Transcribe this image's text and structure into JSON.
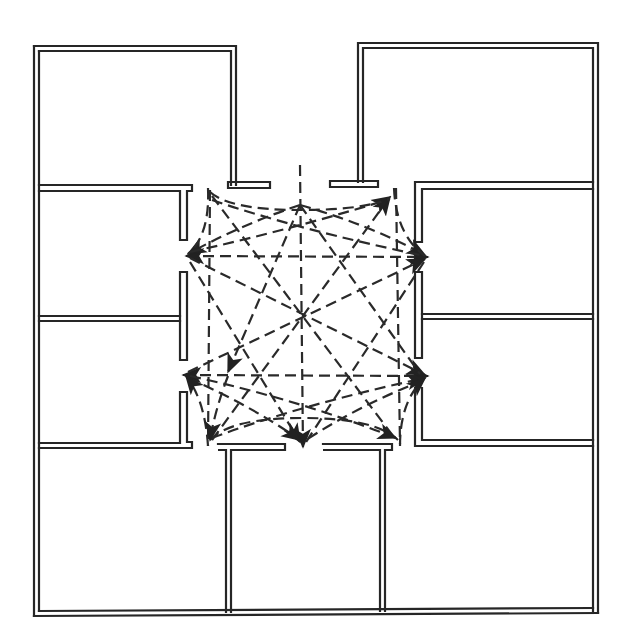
{
  "diagram": {
    "type": "floor-plan-circulation",
    "colors": {
      "ink": "#262626",
      "background": "#ffffff"
    },
    "central_hall": {
      "label": "",
      "bounds": {
        "x": 185,
        "y": 185,
        "w": 245,
        "h": 262
      }
    },
    "rooms": [
      {
        "id": "room-top-left",
        "x": 34,
        "y": 46,
        "w": 202,
        "h": 140
      },
      {
        "id": "room-top-right",
        "x": 358,
        "y": 43,
        "w": 240,
        "h": 140
      },
      {
        "id": "room-left-upper",
        "x": 34,
        "y": 186,
        "w": 148,
        "h": 130
      },
      {
        "id": "room-left-lower",
        "x": 34,
        "y": 316,
        "w": 148,
        "h": 130
      },
      {
        "id": "room-right-upper",
        "x": 420,
        "y": 183,
        "w": 178,
        "h": 132
      },
      {
        "id": "room-right-lower",
        "x": 420,
        "y": 315,
        "w": 178,
        "h": 128
      },
      {
        "id": "room-bottom-left",
        "x": 34,
        "y": 446,
        "w": 192,
        "h": 169
      },
      {
        "id": "room-bottom-middle",
        "x": 226,
        "y": 446,
        "w": 154,
        "h": 168
      },
      {
        "id": "room-bottom-right",
        "x": 380,
        "y": 443,
        "w": 218,
        "h": 170
      }
    ],
    "doorways": [
      {
        "id": "door-top-center",
        "x": 300,
        "y": 185
      },
      {
        "id": "door-left-upper",
        "x": 182,
        "y": 255
      },
      {
        "id": "door-left-lower",
        "x": 182,
        "y": 375
      },
      {
        "id": "door-right-upper",
        "x": 428,
        "y": 257
      },
      {
        "id": "door-right-lower",
        "x": 428,
        "y": 376
      },
      {
        "id": "door-bottom-center",
        "x": 303,
        "y": 450
      },
      {
        "id": "door-corner-top-left",
        "x": 208,
        "y": 190
      },
      {
        "id": "door-corner-top-right",
        "x": 392,
        "y": 192
      },
      {
        "id": "door-corner-bottom-left",
        "x": 208,
        "y": 446
      },
      {
        "id": "door-corner-bottom-right",
        "x": 398,
        "y": 444
      }
    ],
    "legend": [],
    "annotations": []
  }
}
